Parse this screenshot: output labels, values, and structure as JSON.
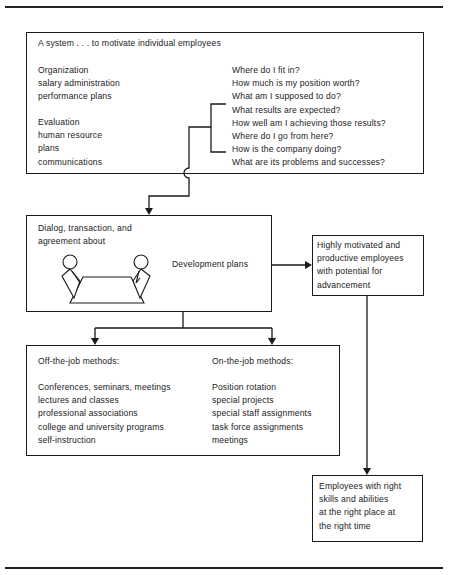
{
  "top_box": {
    "title": "A system . . . to motivate individual employees",
    "left_group_1": [
      "Organization",
      "salary administration",
      "performance plans"
    ],
    "left_group_2": [
      "Evaluation",
      "human resource",
      "plans",
      "communications"
    ],
    "questions": [
      "Where do I fit in?",
      "How much is my position worth?",
      "What am I supposed to do?",
      "What results are expected?",
      "How well am I achieving those results?",
      "Where do I go from here?",
      "How is the company doing?",
      "What are its problems and successes?"
    ]
  },
  "middle_box": {
    "heading_lines": [
      "Dialog, transaction, and",
      "agreement about"
    ],
    "subject": "Development plans",
    "illustration": "two-people-at-table"
  },
  "outcome_box": {
    "lines": [
      "Highly motivated and",
      "productive employees",
      "with potential for",
      "advancement"
    ]
  },
  "methods_box": {
    "off_job": {
      "heading": "Off-the-job methods:",
      "items": [
        "Conferences, seminars, meetings",
        "lectures and classes",
        "professional associations",
        "college and university programs",
        "self-instruction"
      ]
    },
    "on_job": {
      "heading": "On-the-job methods:",
      "items": [
        "Position rotation",
        "special projects",
        "special staff assignments",
        "task force assignments",
        "meetings"
      ]
    }
  },
  "final_box": {
    "lines": [
      "Employees with right",
      "skills and abilities",
      "at the right place at",
      "the right time"
    ]
  }
}
